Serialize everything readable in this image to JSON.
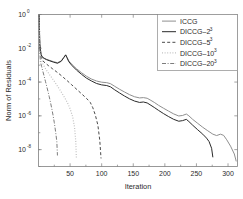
{
  "chart_data": {
    "type": "line",
    "title": "",
    "xlabel": "Iteration",
    "ylabel": "Norm of Residuals",
    "yscale": "log",
    "xlim": [
      0,
      315
    ],
    "ylim": [
      1e-09,
      1
    ],
    "grid": false,
    "legend_position": "top-right",
    "xticks": [
      "50",
      "100",
      "150",
      "200",
      "250",
      "300"
    ],
    "xtick_values": [
      50,
      100,
      150,
      200,
      250,
      300
    ],
    "yticks": [
      "10",
      "10",
      "10",
      "10",
      "10"
    ],
    "ytick_exponents": [
      "0",
      "-2",
      "-4",
      "-6",
      "-8"
    ],
    "ytick_values": [
      1,
      0.01,
      0.0001,
      1e-06,
      1e-08
    ],
    "series": [
      {
        "name": "ICCG",
        "label_base": "ICCG",
        "label_sup": "",
        "color": "#8f8f8f",
        "dash": "none",
        "width": 1.0,
        "points": [
          [
            1,
            1.0
          ],
          [
            2,
            0.02
          ],
          [
            4,
            0.0045
          ],
          [
            6,
            0.0031
          ],
          [
            9,
            0.0026
          ],
          [
            13,
            0.0022
          ],
          [
            18,
            0.0019
          ],
          [
            24,
            0.0016
          ],
          [
            30,
            0.0014
          ],
          [
            36,
            0.0018
          ],
          [
            40,
            0.0029
          ],
          [
            43,
            0.0042
          ],
          [
            45,
            0.003
          ],
          [
            48,
            0.0018
          ],
          [
            53,
            0.0011
          ],
          [
            60,
            0.00062
          ],
          [
            68,
            0.00036
          ],
          [
            76,
            0.00022
          ],
          [
            84,
            0.00015
          ],
          [
            92,
            0.000115
          ],
          [
            100,
            9.8e-05
          ],
          [
            108,
            9.2e-05
          ],
          [
            114,
            8e-05
          ],
          [
            120,
            5.8e-05
          ],
          [
            128,
            3.8e-05
          ],
          [
            136,
            2.6e-05
          ],
          [
            144,
            1.8e-05
          ],
          [
            152,
            1.35e-05
          ],
          [
            160,
            1.15e-05
          ],
          [
            166,
            1.2e-05
          ],
          [
            172,
            1.1e-05
          ],
          [
            178,
            8.2e-06
          ],
          [
            184,
            6e-06
          ],
          [
            190,
            4.2e-06
          ],
          [
            198,
            2.8e-06
          ],
          [
            206,
            1.9e-06
          ],
          [
            214,
            1.3e-06
          ],
          [
            222,
            9.8e-07
          ],
          [
            228,
            1.05e-06
          ],
          [
            234,
            1.28e-06
          ],
          [
            238,
            1e-06
          ],
          [
            244,
            6.2e-07
          ],
          [
            252,
            3.6e-07
          ],
          [
            260,
            2.1e-07
          ],
          [
            268,
            1.3e-07
          ],
          [
            276,
            8.2e-08
          ],
          [
            282,
            6.8e-08
          ],
          [
            288,
            8.2e-08
          ],
          [
            293,
            7e-08
          ],
          [
            298,
            3.8e-08
          ],
          [
            304,
            1.6e-08
          ],
          [
            310,
            5.5e-09
          ],
          [
            313,
            2e-09
          ]
        ]
      },
      {
        "name": "DICCG-2^3",
        "label_base": "DICCG–2",
        "label_sup": "3",
        "color": "#2a2a2a",
        "dash": "none",
        "width": 1.0,
        "points": [
          [
            1,
            1.0
          ],
          [
            2,
            0.018
          ],
          [
            4,
            0.0042
          ],
          [
            6,
            0.003
          ],
          [
            9,
            0.0025
          ],
          [
            13,
            0.0021
          ],
          [
            18,
            0.0018
          ],
          [
            24,
            0.0015
          ],
          [
            30,
            0.0013
          ],
          [
            36,
            0.0017
          ],
          [
            40,
            0.0028
          ],
          [
            43,
            0.004
          ],
          [
            45,
            0.0028
          ],
          [
            48,
            0.0016
          ],
          [
            53,
            0.00095
          ],
          [
            60,
            0.00052
          ],
          [
            68,
            0.00029
          ],
          [
            76,
            0.00017
          ],
          [
            84,
            0.000115
          ],
          [
            92,
            8.2e-05
          ],
          [
            100,
            6.8e-05
          ],
          [
            108,
            6.2e-05
          ],
          [
            114,
            5.2e-05
          ],
          [
            120,
            3.6e-05
          ],
          [
            128,
            2.3e-05
          ],
          [
            136,
            1.5e-05
          ],
          [
            144,
            1.02e-05
          ],
          [
            152,
            7.5e-06
          ],
          [
            160,
            6.2e-06
          ],
          [
            166,
            6.6e-06
          ],
          [
            172,
            5.8e-06
          ],
          [
            178,
            4.2e-06
          ],
          [
            184,
            3e-06
          ],
          [
            190,
            2.1e-06
          ],
          [
            198,
            1.35e-06
          ],
          [
            206,
            9e-07
          ],
          [
            214,
            6.2e-07
          ],
          [
            222,
            4.8e-07
          ],
          [
            228,
            5.2e-07
          ],
          [
            234,
            6.2e-07
          ],
          [
            238,
            4.6e-07
          ],
          [
            244,
            2.8e-07
          ],
          [
            252,
            1.5e-07
          ],
          [
            260,
            8.2e-08
          ],
          [
            266,
            4.8e-08
          ],
          [
            270,
            3e-08
          ],
          [
            274,
            1.2e-08
          ],
          [
            276,
            3.5e-09
          ]
        ]
      },
      {
        "name": "DICCG-5^3",
        "label_base": "DICCG–5",
        "label_sup": "3",
        "color": "#4a4a4a",
        "dash": "3,2.2",
        "width": 1.0,
        "points": [
          [
            1,
            1.0
          ],
          [
            2,
            0.012
          ],
          [
            4,
            0.003
          ],
          [
            7,
            0.0018
          ],
          [
            11,
            0.0013
          ],
          [
            16,
            0.00092
          ],
          [
            22,
            0.00062
          ],
          [
            28,
            0.00042
          ],
          [
            34,
            0.00028
          ],
          [
            40,
            0.00018
          ],
          [
            46,
            0.000115
          ],
          [
            52,
            7.2e-05
          ],
          [
            58,
            4.5e-05
          ],
          [
            64,
            2.8e-05
          ],
          [
            70,
            1.75e-05
          ],
          [
            76,
            1.08e-05
          ],
          [
            82,
            6.2e-06
          ],
          [
            86,
            3e-06
          ],
          [
            90,
            1.1e-06
          ],
          [
            94,
            2.8e-07
          ],
          [
            97,
            3.5e-08
          ],
          [
            99,
            3e-09
          ]
        ]
      },
      {
        "name": "DICCG-10^3",
        "label_base": "DICCG–10",
        "label_sup": "3",
        "color": "#c2c2c2",
        "dash": "1,1.6",
        "width": 1.2,
        "points": [
          [
            1,
            1.0
          ],
          [
            2,
            0.009
          ],
          [
            4,
            0.0022
          ],
          [
            7,
            0.0012
          ],
          [
            10,
            0.00072
          ],
          [
            14,
            0.00042
          ],
          [
            18,
            0.00026
          ],
          [
            22,
            0.00016
          ],
          [
            26,
            9.8e-05
          ],
          [
            30,
            5.8e-05
          ],
          [
            34,
            3.4e-05
          ],
          [
            38,
            1.95e-05
          ],
          [
            42,
            1.1e-05
          ],
          [
            46,
            5.8e-06
          ],
          [
            50,
            2.6e-06
          ],
          [
            54,
            9e-07
          ],
          [
            57,
            2.2e-07
          ],
          [
            59,
            3e-08
          ],
          [
            60,
            3e-09
          ]
        ]
      },
      {
        "name": "DICCG-20^3",
        "label_base": "DICCG–20",
        "label_sup": "3",
        "color": "#6e6e6e",
        "dash": "4,1.6,1,1.6",
        "width": 0.9,
        "points": [
          [
            1,
            1.0
          ],
          [
            2,
            0.006
          ],
          [
            3,
            0.0016
          ],
          [
            5,
            0.00082
          ],
          [
            7,
            0.00042
          ],
          [
            9,
            0.000215
          ],
          [
            11,
            0.00011
          ],
          [
            13,
            5.6e-05
          ],
          [
            15,
            2.8e-05
          ],
          [
            17,
            1.35e-05
          ],
          [
            19,
            6.2e-06
          ],
          [
            21,
            2.7e-06
          ],
          [
            23,
            1.1e-06
          ],
          [
            25,
            4e-07
          ],
          [
            27,
            1.2e-07
          ],
          [
            29,
            3e-08
          ],
          [
            30,
            4.5e-09
          ]
        ]
      }
    ]
  },
  "legend": {
    "items": [
      {
        "label_base": "ICCG",
        "label_sup": ""
      },
      {
        "label_base": "DICCG–2",
        "label_sup": "3"
      },
      {
        "label_base": "DICCG–5",
        "label_sup": "3"
      },
      {
        "label_base": "DICCG–10",
        "label_sup": "3"
      },
      {
        "label_base": "DICCG–20",
        "label_sup": "3"
      }
    ]
  },
  "colors": {
    "axis": "#7d7d7d",
    "text": "#2b2b2b",
    "background": "#ffffff"
  }
}
